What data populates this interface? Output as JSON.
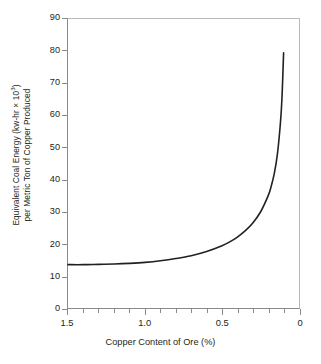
{
  "chart_data": {
    "type": "line",
    "title": "",
    "xlabel": "Copper Content of Ore (%)",
    "ylabel_line1": "Equivalent Coal Energy (kw-hr × 10",
    "ylabel_line1_sup": "3",
    "ylabel_line1_tail": ")",
    "ylabel_line2": "per Metric Ton of Copper Produced",
    "xlim": [
      1.5,
      0.0
    ],
    "ylim": [
      0,
      90
    ],
    "x_reversed": true,
    "grid": false,
    "legend": "none",
    "y_ticks": [
      90,
      80,
      70,
      60,
      50,
      40,
      30,
      20,
      10,
      0
    ],
    "y_tick_labels": [
      "90",
      "80",
      "70",
      "60",
      "50",
      "40",
      "30",
      "20",
      "10",
      "0"
    ],
    "x_major_ticks": [
      1.5,
      1.0,
      0.5,
      0.0
    ],
    "x_major_tick_labels": [
      "1.5",
      "1.0",
      "0.5",
      "0"
    ],
    "x_minor_ticks": [
      1.4,
      1.3,
      1.2,
      1.1,
      0.9,
      0.8,
      0.7,
      0.6,
      0.4,
      0.3,
      0.2,
      0.1
    ],
    "series": [
      {
        "name": "Equivalent coal energy",
        "line_color": "#231f20",
        "line_width": 1.6,
        "x": [
          1.5,
          1.4,
          1.3,
          1.2,
          1.1,
          1.0,
          0.9,
          0.8,
          0.7,
          0.6,
          0.5,
          0.45,
          0.4,
          0.35,
          0.3,
          0.25,
          0.2,
          0.18,
          0.16,
          0.14,
          0.12,
          0.11,
          0.1
        ],
        "y": [
          13.5,
          13.5,
          13.6,
          13.7,
          13.9,
          14.2,
          14.7,
          15.4,
          16.3,
          17.6,
          19.4,
          20.6,
          22.1,
          24.0,
          26.5,
          29.9,
          35.0,
          38.0,
          42.0,
          48.0,
          58.0,
          66.0,
          79.5
        ]
      }
    ]
  },
  "axes": {
    "frame_color_light": "#b9b9b9",
    "frame_color_dark": "#8a8a8a",
    "background": "#ffffff"
  }
}
